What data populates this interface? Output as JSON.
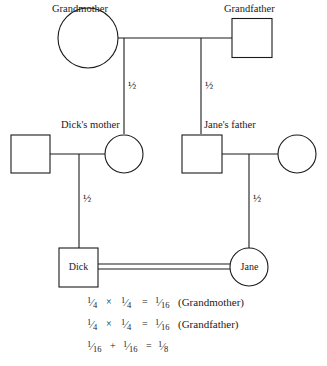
{
  "diagram": {
    "line_color": "#1a1a1a",
    "background_color": "#ffffff",
    "generations": [
      {
        "level": 1,
        "individuals": [
          {
            "id": "grandmother",
            "label": "Grandmother",
            "shape": "circle"
          },
          {
            "id": "grandfather",
            "label": "Grandfather",
            "shape": "square"
          }
        ]
      },
      {
        "level": 2,
        "individuals": [
          {
            "id": "dicks-father",
            "label": "",
            "shape": "square"
          },
          {
            "id": "dicks-mother",
            "label": "Dick's mother",
            "shape": "circle"
          },
          {
            "id": "janes-father",
            "label": "Jane's father",
            "shape": "square"
          },
          {
            "id": "janes-mother",
            "label": "",
            "shape": "circle"
          }
        ]
      },
      {
        "level": 3,
        "individuals": [
          {
            "id": "dick",
            "label": "Dick",
            "shape": "square"
          },
          {
            "id": "jane",
            "label": "Jane",
            "shape": "circle"
          }
        ]
      }
    ],
    "transmission_labels": [
      {
        "id": "gm-to-dicks-mother",
        "value": "½"
      },
      {
        "id": "gf-to-janes-father",
        "value": "½"
      },
      {
        "id": "dicks-mother-to-dick",
        "value": "½"
      },
      {
        "id": "janes-father-to-jane",
        "value": "½"
      }
    ],
    "consanguineous_mating": {
      "partners": [
        "Dick",
        "Jane"
      ],
      "line_style": "double"
    }
  },
  "equations": [
    {
      "id": "grandmother-equation",
      "terms": [
        {
          "num": "1",
          "den": "4"
        },
        {
          "num": "1",
          "den": "4"
        },
        {
          "num": "1",
          "den": "16"
        }
      ],
      "operator": "×",
      "equals": "=",
      "annotation": "(Grandmother)"
    },
    {
      "id": "grandfather-equation",
      "terms": [
        {
          "num": "1",
          "den": "4"
        },
        {
          "num": "1",
          "den": "4"
        },
        {
          "num": "1",
          "den": "16"
        }
      ],
      "operator": "×",
      "equals": "=",
      "annotation": "(Grandfather)"
    },
    {
      "id": "total-equation",
      "terms": [
        {
          "num": "1",
          "den": "16"
        },
        {
          "num": "1",
          "den": "16"
        },
        {
          "num": "1",
          "den": "8"
        }
      ],
      "operator": "+",
      "equals": "=",
      "annotation": ""
    }
  ]
}
